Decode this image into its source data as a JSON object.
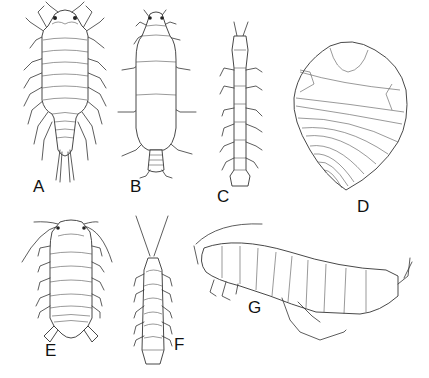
{
  "figure": {
    "panels": [
      {
        "id": "A",
        "label": "A",
        "form": "dorsal view, isopod with long tapered pleotelson and uropods"
      },
      {
        "id": "B",
        "label": "B",
        "form": "dorsal view, oval-bodied isopod with narrow segmented pleon"
      },
      {
        "id": "C",
        "label": "C",
        "form": "dorsal view, elongate slender isopod"
      },
      {
        "id": "D",
        "label": "D",
        "form": "rolled (conglobated) isopod, ventral-lateral view"
      },
      {
        "id": "E",
        "label": "E",
        "form": "dorsal view, broad isopod with long antennae"
      },
      {
        "id": "F",
        "label": "F",
        "form": "dorsal view, narrow isopod with long antennae"
      },
      {
        "id": "G",
        "label": "G",
        "form": "lateral view, amphipod"
      }
    ]
  },
  "colors": {
    "background": "#ffffff",
    "ink": "#333333"
  }
}
